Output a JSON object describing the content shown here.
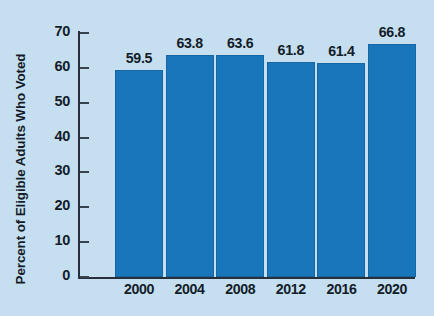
{
  "chart_data": {
    "type": "bar",
    "title": "",
    "subtitle": "",
    "xlabel": "",
    "ylabel": "Percent of Eligible Adults Who Voted",
    "categories": [
      "2000",
      "2004",
      "2008",
      "2012",
      "2016",
      "2020"
    ],
    "values": [
      59.5,
      63.8,
      63.6,
      61.8,
      61.4,
      66.8
    ],
    "value_labels": [
      "59.5",
      "63.8",
      "63.6",
      "61.8",
      "61.4",
      "66.8"
    ],
    "ylim": [
      0,
      70
    ],
    "ytick_labels": [
      "0",
      "10",
      "20",
      "30",
      "40",
      "50",
      "60",
      "70"
    ],
    "ytick_values": [
      0,
      10,
      20,
      30,
      40,
      50,
      60,
      70
    ],
    "grid": false,
    "legend": null,
    "legend_position": "none",
    "series": [
      {
        "name": "Percent of Eligible Adults Who Voted",
        "values": [
          59.5,
          63.8,
          63.6,
          61.8,
          61.4,
          66.8
        ]
      }
    ]
  },
  "colors": {
    "background": "#c5dff1",
    "bar_fill": "#1a76bb",
    "bar_stroke": "#1566a4",
    "axis": "#262f3b",
    "text": "#131c28"
  }
}
